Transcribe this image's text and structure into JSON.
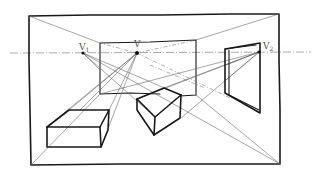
{
  "colors": {
    "ink": "#1a1a1a",
    "construction": "#6a6a6a",
    "horizon": "#888888",
    "label": "#555555",
    "background": "#ffffff"
  },
  "labels": {
    "vp_left": "V",
    "vp_left_sub": "1",
    "vp_center": "V",
    "vp_right": "V",
    "vp_right_sub": "2"
  },
  "elements": {
    "horizon_line": "horizon-line",
    "outer_frame": "room-frame",
    "back_wall": "back-wall",
    "left_box": "left-box",
    "center_box": "center-box",
    "right_window": "right-wall-window"
  }
}
